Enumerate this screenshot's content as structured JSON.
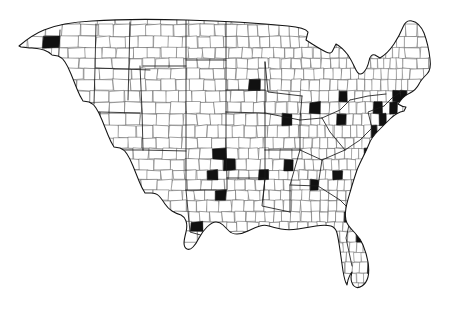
{
  "figure": {
    "kind": "map",
    "title": "",
    "subtitle": "",
    "caption": "",
    "legend_present": false,
    "axis_present": false,
    "background_color": "#ffffff",
    "width_px": 457,
    "height_px": 309
  },
  "map": {
    "name": "contiguous-united-states-county-map",
    "region": "Contiguous United States",
    "includes_alaska": false,
    "includes_hawaii": false,
    "projection_look": "albers-conic",
    "geography_level": "county",
    "symbology": "solid-fill-highlight",
    "colors": {
      "land": "#ffffff",
      "county_border": "#3f3f3f",
      "state_border": "#1b1b1b",
      "nation_border": "#141414",
      "highlight_fill": "#111111"
    },
    "extent_px": {
      "x_min": 18,
      "x_max": 440,
      "y_min": 18,
      "y_max": 292
    },
    "density_note": "Western counties large and sparse; eastern counties small and densely packed",
    "highlighted_clusters": [
      {
        "label": "Seattle-Puget Sound",
        "x": 48,
        "y": 38,
        "size": 9
      },
      {
        "label": "Portland",
        "x": 32,
        "y": 58,
        "size": 5
      },
      {
        "label": "San Francisco Bay Area",
        "x": 24,
        "y": 127,
        "size": 10
      },
      {
        "label": "Sacramento",
        "x": 33,
        "y": 120,
        "size": 5
      },
      {
        "label": "Los Angeles",
        "x": 33,
        "y": 140,
        "size": 8
      },
      {
        "label": "San Diego",
        "x": 38,
        "y": 150,
        "size": 5
      },
      {
        "label": "Las Vegas",
        "x": 60,
        "y": 133,
        "size": 5
      },
      {
        "label": "Salt Lake City",
        "x": 128,
        "y": 89,
        "size": 8
      },
      {
        "label": "Boise",
        "x": 95,
        "y": 66,
        "size": 4
      },
      {
        "label": "Denver",
        "x": 158,
        "y": 138,
        "size": 11
      },
      {
        "label": "Colorado Springs",
        "x": 164,
        "y": 147,
        "size": 5
      },
      {
        "label": "Albuquerque",
        "x": 150,
        "y": 175,
        "size": 4
      },
      {
        "label": "Phoenix",
        "x": 78,
        "y": 168,
        "size": 6
      },
      {
        "label": "Tucson",
        "x": 92,
        "y": 183,
        "size": 4
      },
      {
        "label": "El Paso",
        "x": 148,
        "y": 200,
        "size": 4
      },
      {
        "label": "Minneapolis-St Paul",
        "x": 253,
        "y": 84,
        "size": 9
      },
      {
        "label": "Omaha",
        "x": 226,
        "y": 124,
        "size": 5
      },
      {
        "label": "Kansas City",
        "x": 235,
        "y": 138,
        "size": 5
      },
      {
        "label": "Wichita",
        "x": 219,
        "y": 153,
        "size": 4
      },
      {
        "label": "Oklahoma City",
        "x": 216,
        "y": 175,
        "size": 5
      },
      {
        "label": "Tulsa",
        "x": 228,
        "y": 168,
        "size": 4
      },
      {
        "label": "Dallas-Fort Worth",
        "x": 219,
        "y": 198,
        "size": 6
      },
      {
        "label": "Austin",
        "x": 207,
        "y": 222,
        "size": 4
      },
      {
        "label": "San Antonio",
        "x": 198,
        "y": 228,
        "size": 5
      },
      {
        "label": "Houston",
        "x": 232,
        "y": 223,
        "size": 6
      },
      {
        "label": "St Louis",
        "x": 263,
        "y": 146,
        "size": 5
      },
      {
        "label": "Chicago",
        "x": 285,
        "y": 113,
        "size": 9
      },
      {
        "label": "Milwaukee",
        "x": 279,
        "y": 99,
        "size": 5
      },
      {
        "label": "Indianapolis",
        "x": 297,
        "y": 131,
        "size": 4
      },
      {
        "label": "Detroit",
        "x": 314,
        "y": 108,
        "size": 8
      },
      {
        "label": "Cleveland",
        "x": 328,
        "y": 113,
        "size": 6
      },
      {
        "label": "Columbus",
        "x": 320,
        "y": 126,
        "size": 4
      },
      {
        "label": "Cincinnati",
        "x": 310,
        "y": 134,
        "size": 4
      },
      {
        "label": "Pittsburgh",
        "x": 342,
        "y": 120,
        "size": 5
      },
      {
        "label": "Nashville",
        "x": 290,
        "y": 164,
        "size": 4
      },
      {
        "label": "Memphis",
        "x": 263,
        "y": 172,
        "size": 4
      },
      {
        "label": "Louisville",
        "x": 302,
        "y": 145,
        "size": 4
      },
      {
        "label": "Atlanta",
        "x": 312,
        "y": 188,
        "size": 7
      },
      {
        "label": "Birmingham",
        "x": 290,
        "y": 192,
        "size": 4
      },
      {
        "label": "New Orleans",
        "x": 263,
        "y": 223,
        "size": 4
      },
      {
        "label": "Charlotte",
        "x": 338,
        "y": 173,
        "size": 4
      },
      {
        "label": "Raleigh",
        "x": 355,
        "y": 166,
        "size": 4
      },
      {
        "label": "Norfolk",
        "x": 366,
        "y": 153,
        "size": 4
      },
      {
        "label": "Richmond",
        "x": 357,
        "y": 148,
        "size": 4
      },
      {
        "label": "Washington-Baltimore",
        "x": 360,
        "y": 136,
        "size": 9
      },
      {
        "label": "Philadelphia",
        "x": 372,
        "y": 126,
        "size": 8
      },
      {
        "label": "New York City",
        "x": 384,
        "y": 113,
        "size": 11
      },
      {
        "label": "Hartford",
        "x": 392,
        "y": 105,
        "size": 5
      },
      {
        "label": "Providence",
        "x": 400,
        "y": 103,
        "size": 4
      },
      {
        "label": "Boston",
        "x": 401,
        "y": 96,
        "size": 8
      },
      {
        "label": "Buffalo",
        "x": 344,
        "y": 100,
        "size": 4
      },
      {
        "label": "Albany",
        "x": 378,
        "y": 98,
        "size": 4
      },
      {
        "label": "Tampa",
        "x": 351,
        "y": 243,
        "size": 4
      },
      {
        "label": "Orlando",
        "x": 358,
        "y": 238,
        "size": 4
      },
      {
        "label": "Miami",
        "x": 368,
        "y": 268,
        "size": 4
      },
      {
        "label": "Jacksonville",
        "x": 348,
        "y": 215,
        "size": 4
      }
    ]
  }
}
